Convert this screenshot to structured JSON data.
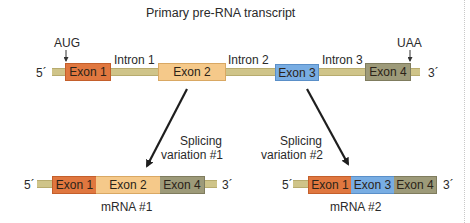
{
  "title": "Primary pre-RNA transcript",
  "pre_rna": {
    "five_prime": "5´",
    "three_prime": "3´",
    "start_codon": "AUG",
    "stop_codon": "UAA",
    "exons": [
      {
        "label": "Exon 1",
        "color": "#e0773f"
      },
      {
        "label": "Exon 2",
        "color": "#f5c98a"
      },
      {
        "label": "Exon 3",
        "color": "#78ade3"
      },
      {
        "label": "Exon 4",
        "color": "#9d9a79"
      }
    ],
    "introns": [
      "Intron 1",
      "Intron 2",
      "Intron 3"
    ],
    "intron_color": "#cfc489"
  },
  "variations": [
    {
      "label_line1": "Splicing",
      "label_line2": "variation #1",
      "mrna_label": "mRNA #1",
      "five_prime": "5´",
      "three_prime": "3´",
      "exons": [
        "Exon 1",
        "Exon 2",
        "Exon 4"
      ]
    },
    {
      "label_line1": "Splicing",
      "label_line2": "variation #2",
      "mrna_label": "mRNA #2",
      "five_prime": "5´",
      "three_prime": "3´",
      "exons": [
        "Exon 1",
        "Exon 3",
        "Exon 4"
      ]
    }
  ]
}
